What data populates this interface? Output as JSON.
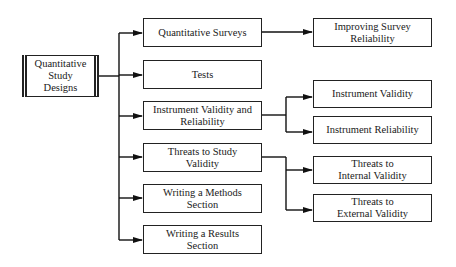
{
  "diagram": {
    "root": {
      "label": "Quantitative\nStudy\nDesigns"
    },
    "topics": [
      {
        "label": "Quantitative Surveys"
      },
      {
        "label": "Tests"
      },
      {
        "label": "Instrument Validity and\nReliability"
      },
      {
        "label": "Threats to Study\nValidity"
      },
      {
        "label": "Writing a Methods\nSection"
      },
      {
        "label": "Writing a Results\nSection"
      }
    ],
    "subtopics": [
      {
        "label": "Improving Survey\nReliability",
        "parent": "Quantitative Surveys"
      },
      {
        "label": "Instrument Validity",
        "parent": "Instrument Validity and Reliability"
      },
      {
        "label": "Instrument Reliability",
        "parent": "Instrument Validity and Reliability"
      },
      {
        "label": "Threats to\nInternal Validity",
        "parent": "Threats to Study Validity"
      },
      {
        "label": "Threats to\nExternal Validity",
        "parent": "Threats to Study Validity"
      }
    ]
  }
}
